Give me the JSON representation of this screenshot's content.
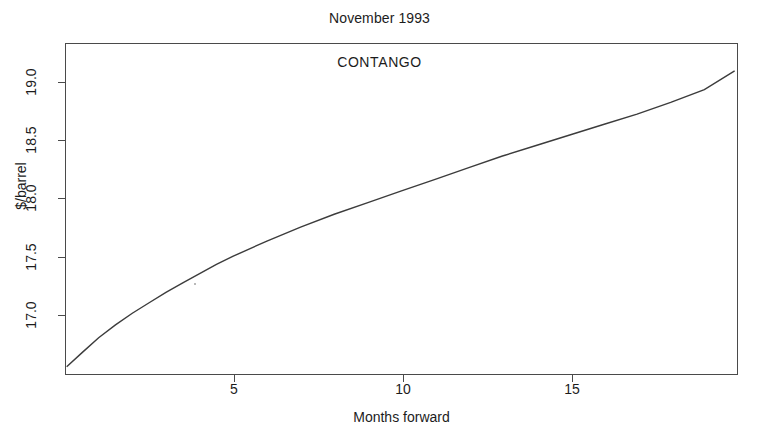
{
  "chart_data": {
    "type": "line",
    "title": "November 1993",
    "xlabel": "Months forward",
    "ylabel": "$/barrel",
    "annotation": "CONTANGO",
    "grid": false,
    "legend": null,
    "xlim": [
      0,
      20
    ],
    "ylim": [
      16.55,
      19.4
    ],
    "xticks": [
      5,
      10,
      15
    ],
    "xtick_labels": [
      "5",
      "10",
      "15"
    ],
    "yticks": [
      17.0,
      17.5,
      18.0,
      18.5,
      19.0
    ],
    "ytick_labels": [
      "17.0",
      "17.5",
      "18.0",
      "18.5",
      "19.0"
    ],
    "series": [
      {
        "name": "Forward curve",
        "color": "#3c3c3c",
        "x": [
          0.05,
          0.5,
          1,
          1.5,
          2,
          2.5,
          3,
          3.5,
          4,
          4.5,
          5,
          6,
          7,
          8,
          9,
          10,
          11,
          12,
          13,
          14,
          15,
          16,
          17,
          18,
          19,
          19.9
        ],
        "y": [
          16.62,
          16.74,
          16.87,
          16.98,
          17.08,
          17.17,
          17.26,
          17.34,
          17.42,
          17.5,
          17.57,
          17.7,
          17.82,
          17.93,
          18.03,
          18.13,
          18.23,
          18.33,
          18.43,
          18.52,
          18.61,
          18.7,
          18.79,
          18.89,
          19.0,
          19.16
        ]
      }
    ]
  },
  "figure": {
    "title_text": "November 1993",
    "annotation_text": "CONTANGO",
    "x_axis_title": "Months forward",
    "y_axis_title": "$/barrel",
    "x_tick_labels": [
      "5",
      "10",
      "15"
    ],
    "y_tick_labels": [
      "17.0",
      "17.5",
      "18.0",
      "18.5",
      "19.0"
    ],
    "colors": {
      "curve": "#3c3c3c",
      "frame": "#4a4a4a",
      "text": "#1c1c1c",
      "background": "#ffffff"
    }
  }
}
